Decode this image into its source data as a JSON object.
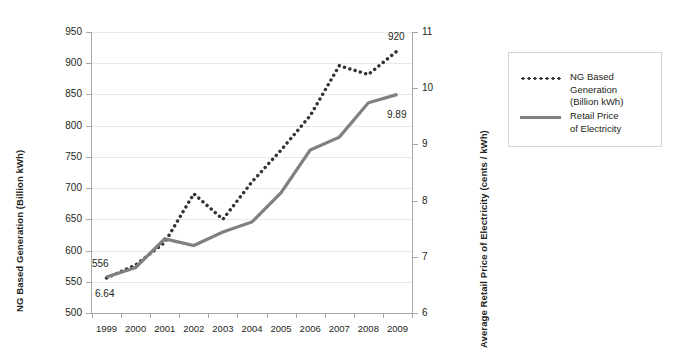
{
  "chart_data": {
    "type": "line",
    "title": "",
    "xlabel": "",
    "categories": [
      "1999",
      "2000",
      "2001",
      "2002",
      "2003",
      "2004",
      "2005",
      "2006",
      "2007",
      "2008",
      "2009"
    ],
    "grid": true,
    "legend_position": "right",
    "series": [
      {
        "name": "NG Based Generation (Billion kWh)",
        "axis": "left",
        "style": "dotted",
        "color": "#333333",
        "values": [
          556,
          577,
          613,
          691,
          650,
          710,
          761,
          816,
          896,
          882,
          920
        ]
      },
      {
        "name": "Retail Price of Electricity",
        "axis": "right",
        "style": "solid",
        "color": "#808080",
        "values": [
          6.64,
          6.81,
          7.32,
          7.2,
          7.44,
          7.62,
          8.14,
          8.9,
          9.13,
          9.74,
          9.89
        ]
      }
    ],
    "y_left": {
      "label": "NG Based Generation (Billion kWh)",
      "ticks": [
        950,
        900,
        850,
        800,
        750,
        700,
        650,
        600,
        550,
        500
      ],
      "ylim": [
        500,
        950
      ]
    },
    "y_right": {
      "label": "Average Retail Price of Electricity (cents / kWh)",
      "ticks": [
        11,
        10,
        9,
        8,
        7,
        6
      ],
      "ylim": [
        6,
        11
      ]
    },
    "point_labels": {
      "ng_start": "556",
      "ng_end": "920",
      "rp_start": "6.64",
      "rp_end": "9.89"
    }
  },
  "legend": {
    "items": [
      {
        "label": "NG Based\nGeneration\n(Billion kWh)",
        "marker": "dotted-line-icon"
      },
      {
        "label": "Retail Price\nof Electricity",
        "marker": "solid-line-icon"
      }
    ]
  },
  "axes": {
    "left_title": "NG Based Generation (Billion kWh)",
    "right_title": "Average Retail Price of Electricity (cents / kWh)"
  }
}
